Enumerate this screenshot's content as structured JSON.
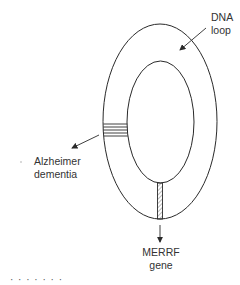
{
  "diagram": {
    "colors": {
      "stroke": "#2a2a2a",
      "background": "#ffffff",
      "text": "#333333"
    },
    "shapes": {
      "outer_loop": {
        "cx": 160,
        "cy": 121.5,
        "rx": 57,
        "ry": 97.5
      },
      "inner_loop": {
        "cx": 160.5,
        "cy": 122,
        "rx": 33.5,
        "ry": 61
      },
      "striped_band": {
        "position": "left side",
        "stripe_count": 5
      },
      "hatched_band": {
        "position": "bottom",
        "pattern": "diagonal hatch"
      }
    },
    "labels": {
      "dna_loop": {
        "line1": "DNA",
        "line2": "loop"
      },
      "alzheimer": {
        "line1": "Alzheimer",
        "line2": "dementia"
      },
      "merrf": {
        "line1": "MERRF",
        "line2": "gene"
      },
      "cut_off_caption": "·   ·  ·   ·  ·  ·   ·"
    }
  }
}
